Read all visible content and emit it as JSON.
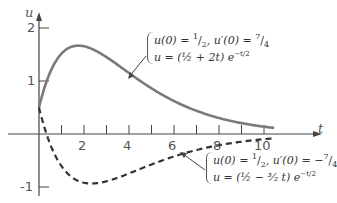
{
  "chart_data": {
    "type": "line",
    "title": "",
    "xlabel": "t",
    "ylabel": "u",
    "xlim": [
      -2.7,
      12.5
    ],
    "ylim": [
      -1.2,
      2.3
    ],
    "x_ticks": [
      1,
      2,
      3,
      4,
      5,
      6,
      7,
      8,
      9,
      10
    ],
    "x_tick_labels": [
      "2",
      "4",
      "6",
      "8",
      "10"
    ],
    "y_ticks": [
      -1,
      1,
      2
    ],
    "y_tick_labels": [
      "-1",
      "1",
      "2"
    ],
    "grid": false,
    "series": [
      {
        "name": "u = (1/2 + 2t) e^{-t/2}",
        "style": "solid",
        "color": "#7a7a7a",
        "initial_conditions": "u(0) = 1/2, u'(0) = 7/4",
        "x": [
          0,
          0.5,
          1,
          1.5,
          2,
          3,
          4,
          5,
          6,
          7,
          8,
          9,
          10,
          10.5
        ],
        "values": [
          0.5,
          1.17,
          1.52,
          1.65,
          1.66,
          1.44,
          1.15,
          0.86,
          0.62,
          0.45,
          0.31,
          0.21,
          0.14,
          0.12
        ]
      },
      {
        "name": "u = (1/2 - 3/2 t) e^{-t/2}",
        "style": "dashed",
        "color": "#333333",
        "initial_conditions": "u(0) = 1/2, u'(0) = -7/4",
        "x": [
          0,
          0.5,
          1,
          1.5,
          2,
          2.33,
          3,
          4,
          5,
          6,
          7,
          8,
          9,
          10,
          10.5
        ],
        "values": [
          0.5,
          -0.19,
          -0.61,
          -0.83,
          -0.92,
          -0.93,
          -0.89,
          -0.74,
          -0.57,
          -0.42,
          -0.3,
          -0.21,
          -0.14,
          -0.1,
          -0.08
        ]
      }
    ],
    "annotations": [
      {
        "line1": "u(0) = 1/2,  u'(0) = 7/4",
        "line2": "u = (1/2 + 2t) e^{-t/2}"
      },
      {
        "line1": "u(0) = 1/2,  u'(0) = -7/4",
        "line2": "u = (1/2 - 3/2 t) e^{-t/2}"
      }
    ]
  },
  "labels": {
    "x_axis": "t",
    "y_axis": "u",
    "x_ticks": [
      "2",
      "4",
      "6",
      "8",
      "10"
    ],
    "y_ticks": [
      "2",
      "1",
      "-1"
    ],
    "anno_top_l1_a": "u(0) = ",
    "anno_top_l1_frac1_num": "1",
    "anno_top_l1_frac1_den": "2",
    "anno_top_l1_b": ",  u′(0) = ",
    "anno_top_l1_frac2_num": "7",
    "anno_top_l1_frac2_den": "4",
    "anno_top_l2": "u = (½ + 2t) e",
    "anno_top_l2_exp": "−t/2",
    "anno_bot_l1_a": "u(0) = ",
    "anno_bot_l1_frac1_num": "1",
    "anno_bot_l1_frac1_den": "2",
    "anno_bot_l1_b": ",  u′(0) = −",
    "anno_bot_l1_frac2_num": "7",
    "anno_bot_l1_frac2_den": "4",
    "anno_bot_l2": "u = (½ − ³⁄₂ t) e",
    "anno_bot_l2_exp": "−t/2"
  }
}
